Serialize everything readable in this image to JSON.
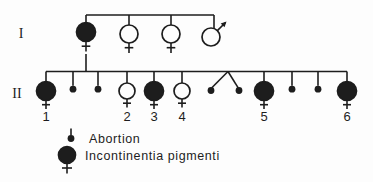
{
  "figure": {
    "type": "pedigree-chart",
    "width": 373,
    "height": 182,
    "colors": {
      "background": "#fdfdfd",
      "line": "#1d1d1d",
      "affected_fill": "#1d1d1d",
      "unaffected_fill": "#fdfdfd",
      "text": "#1d1d1d"
    },
    "generations": [
      {
        "label": "I",
        "label_x": 21,
        "label_y": 38,
        "line_y": 15,
        "members": [
          {
            "id": "I-1",
            "x": 86,
            "y": 32,
            "sex": "female",
            "affected": true,
            "has_descent": true
          },
          {
            "id": "I-2",
            "x": 129,
            "y": 34,
            "sex": "female",
            "affected": false
          },
          {
            "id": "I-3",
            "x": 171,
            "y": 34,
            "sex": "female",
            "affected": false
          },
          {
            "id": "I-4",
            "x": 211,
            "y": 37,
            "sex": "male",
            "affected": false,
            "drop_x": 214
          }
        ]
      },
      {
        "label": "II",
        "label_x": 17,
        "label_y": 98,
        "line_y": 71.5,
        "line_x1": 46,
        "line_x2": 347,
        "symbol_y": 91,
        "number_y": 121,
        "members": [
          {
            "id": "II-1",
            "kind": "person",
            "x": 46,
            "sex": "female",
            "affected": true,
            "label": "1"
          },
          {
            "id": "II-a1",
            "kind": "abortion",
            "x": 73
          },
          {
            "id": "II-a2",
            "kind": "abortion",
            "x": 98
          },
          {
            "id": "II-2",
            "kind": "person",
            "x": 127,
            "sex": "female",
            "affected": false,
            "label": "2"
          },
          {
            "id": "II-3",
            "kind": "person",
            "x": 154,
            "sex": "female",
            "affected": true,
            "label": "3"
          },
          {
            "id": "II-4",
            "kind": "person",
            "x": 182,
            "sex": "female",
            "affected": false,
            "label": "4"
          },
          {
            "id": "II-twins",
            "kind": "twin_abortions",
            "apex_x": 228,
            "x1": 211,
            "x2": 239
          },
          {
            "id": "II-5",
            "kind": "person",
            "x": 264,
            "sex": "female",
            "affected": true,
            "label": "5"
          },
          {
            "id": "II-a3",
            "kind": "abortion",
            "x": 292
          },
          {
            "id": "II-a4",
            "kind": "abortion",
            "x": 318
          },
          {
            "id": "II-6",
            "kind": "person",
            "x": 347,
            "sex": "female",
            "affected": true,
            "label": "6"
          }
        ]
      }
    ],
    "legend": {
      "items": [
        {
          "key": "abortion",
          "label": "Abortion",
          "symbol_x": 71,
          "symbol_y": 138.5,
          "text_x": 89,
          "text_y": 142.5
        },
        {
          "key": "affected_female",
          "label": "Incontinentia pigmenti",
          "symbol_x": 67,
          "symbol_y": 155,
          "text_x": 85,
          "text_y": 160
        }
      ]
    }
  }
}
